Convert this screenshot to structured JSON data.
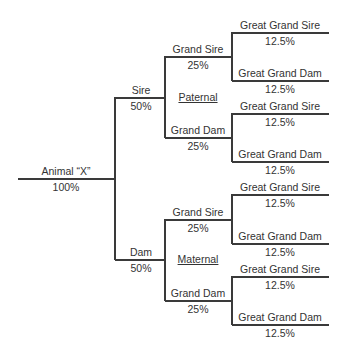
{
  "root": {
    "label": "Animal “X”",
    "pct": "100%"
  },
  "sire": {
    "label": "Sire",
    "pct": "50%",
    "side_label": "Paternal",
    "grand_sire": {
      "label": "Grand Sire",
      "pct": "25%",
      "ggs": {
        "label": "Great Grand Sire",
        "pct": "12.5%"
      },
      "ggd": {
        "label": "Great Grand Dam",
        "pct": "12.5%"
      }
    },
    "grand_dam": {
      "label": "Grand Dam",
      "pct": "25%",
      "ggs": {
        "label": "Great Grand Sire",
        "pct": "12.5%"
      },
      "ggd": {
        "label": "Great Grand Dam",
        "pct": "12.5%"
      }
    }
  },
  "dam": {
    "label": "Dam",
    "pct": "50%",
    "side_label": "Maternal",
    "grand_sire": {
      "label": "Grand Sire",
      "pct": "25%",
      "ggs": {
        "label": "Great Grand Sire",
        "pct": "12.5%"
      },
      "ggd": {
        "label": "Great Grand Dam",
        "pct": "12.5%"
      }
    },
    "grand_dam": {
      "label": "Grand Dam",
      "pct": "25%",
      "ggs": {
        "label": "Great Grand Sire",
        "pct": "12.5%"
      },
      "ggd": {
        "label": "Great Grand Dam",
        "pct": "12.5%"
      }
    }
  }
}
